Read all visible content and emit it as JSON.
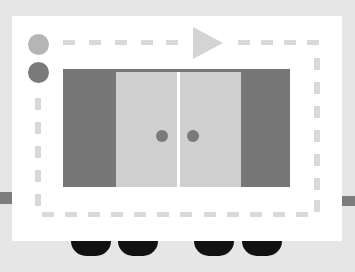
{
  "scene": {
    "description": "Flat illustration of an elevator/rail car with sliding doors, dashed outline, indicator dots and a play arrow",
    "colors": {
      "background": "#e6e6e6",
      "card": "#ffffff",
      "dash": "#d9d9d9",
      "track": "#7d7d7d",
      "panel": "#777777",
      "door": "#cfcfcf",
      "door_gap": "#ffffff",
      "knob": "#7a7a7a",
      "indicator_light": "#b5b5b5",
      "indicator_dark": "#7a7a7a",
      "play_arrow": "#d4d4d4",
      "wheel": "#111111"
    },
    "indicators": [
      {
        "name": "indicator-light",
        "state": "off"
      },
      {
        "name": "indicator-dark",
        "state": "on"
      }
    ],
    "doors": [
      {
        "name": "left-door",
        "knob": true
      },
      {
        "name": "right-door",
        "knob": true
      }
    ],
    "wheels": 4,
    "play_icon": "play-icon"
  }
}
